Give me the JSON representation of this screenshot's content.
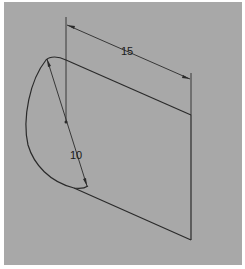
{
  "drawing": {
    "type": "cad-sketch",
    "background_color": "#a8a8a8",
    "line_color": "#2a2a2a",
    "dimensions": [
      {
        "name": "length",
        "label": "15"
      },
      {
        "name": "diameter",
        "label": "10"
      }
    ]
  }
}
